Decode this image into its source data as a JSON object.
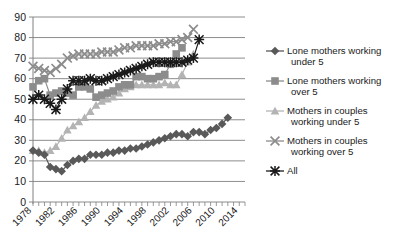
{
  "chart_data": {
    "type": "line",
    "title": "",
    "xlabel": "",
    "ylabel": "",
    "ylim": [
      0,
      90
    ],
    "ytick_step": 10,
    "yticks": [
      "0",
      "10",
      "20",
      "30",
      "40",
      "50",
      "60",
      "70",
      "80",
      "90"
    ],
    "grid": "horizontal",
    "legend_position": "right",
    "xlim": [
      1978,
      2015
    ],
    "x": [
      1978,
      1979,
      1980,
      1981,
      1982,
      1983,
      1984,
      1985,
      1986,
      1987,
      1988,
      1989,
      1990,
      1991,
      1992,
      1993,
      1994,
      1995,
      1996,
      1997,
      1998,
      1999,
      2000,
      2001,
      2002,
      2003,
      2004,
      2005,
      2006,
      2007,
      2008,
      2009,
      2010,
      2011,
      2012,
      2013,
      2014,
      2015
    ],
    "xtick_labels": [
      "1978",
      "1982",
      "1986",
      "1990",
      "1994",
      "1998",
      "2002",
      "2006",
      "2010",
      "2014"
    ],
    "xtick_values": [
      1978,
      1982,
      1986,
      1990,
      1994,
      1998,
      2002,
      2006,
      2010,
      2014
    ],
    "series": [
      {
        "name": "Lone mothers working under 5",
        "marker": "diamond",
        "color": "#595959",
        "values": [
          25,
          24,
          23,
          17,
          16,
          15,
          18,
          20,
          21,
          21,
          23,
          23,
          23,
          24,
          24,
          25,
          25,
          26,
          26,
          27,
          28,
          29,
          30,
          31,
          32,
          33,
          33,
          32,
          34,
          34,
          33,
          35,
          36,
          38,
          41,
          null,
          null,
          null
        ]
      },
      {
        "name": "Lone mothers working over 5",
        "marker": "square",
        "color": "#8c8c8c",
        "values": [
          56,
          59,
          60,
          52,
          53,
          54,
          53,
          52,
          56,
          56,
          55,
          51,
          52,
          53,
          54,
          56,
          57,
          57,
          61,
          61,
          60,
          60,
          61,
          62,
          67,
          72,
          75,
          null,
          null,
          null,
          null,
          null,
          null,
          null,
          null,
          null,
          null,
          null
        ]
      },
      {
        "name": "Mothers in couples working under 5",
        "marker": "triangle",
        "color": "#b3b3b3",
        "values": [
          25,
          25,
          24,
          25,
          27,
          31,
          35,
          37,
          39,
          41,
          44,
          47,
          49,
          50,
          51,
          53,
          55,
          56,
          57,
          57,
          57,
          57,
          57,
          58,
          57,
          57,
          62,
          68,
          72,
          null,
          null,
          null,
          null,
          null,
          null,
          null,
          null,
          null
        ]
      },
      {
        "name": "Mothers in couples working over 5",
        "marker": "cross",
        "color": "#8c8c8c",
        "values": [
          66,
          65,
          64,
          63,
          65,
          67,
          70,
          71,
          72,
          72,
          72,
          72,
          73,
          73,
          73,
          74,
          75,
          75,
          76,
          76,
          76,
          76,
          77,
          77,
          78,
          78,
          79,
          80,
          84,
          null,
          null,
          null,
          null,
          null,
          null,
          null,
          null,
          null
        ]
      },
      {
        "name": "All",
        "marker": "asterisk",
        "color": "#1a1a1a",
        "values": [
          50,
          52,
          50,
          48,
          45,
          50,
          55,
          59,
          59,
          59,
          60,
          59,
          59,
          60,
          61,
          62,
          63,
          64,
          65,
          66,
          67,
          68,
          68,
          68,
          68,
          68,
          68,
          69,
          70,
          79,
          null,
          null,
          null,
          null,
          null,
          null,
          null,
          null
        ]
      }
    ],
    "legend": [
      {
        "label_line1": "Lone mothers working",
        "label_line2": "under 5",
        "marker": "diamond",
        "color": "#595959"
      },
      {
        "label_line1": "Lone mothers working",
        "label_line2": "over 5",
        "marker": "square",
        "color": "#8c8c8c"
      },
      {
        "label_line1": "Mothers in couples",
        "label_line2": "working under 5",
        "marker": "triangle",
        "color": "#b3b3b3"
      },
      {
        "label_line1": "Mothers in couples",
        "label_line2": "working over 5",
        "marker": "cross",
        "color": "#8c8c8c"
      },
      {
        "label_line1": "All",
        "label_line2": "",
        "marker": "asterisk",
        "color": "#1a1a1a"
      }
    ],
    "colors": {
      "grid": "#808080",
      "axis": "#808080",
      "text": "#1a1a1a",
      "background": "#ffffff"
    }
  }
}
